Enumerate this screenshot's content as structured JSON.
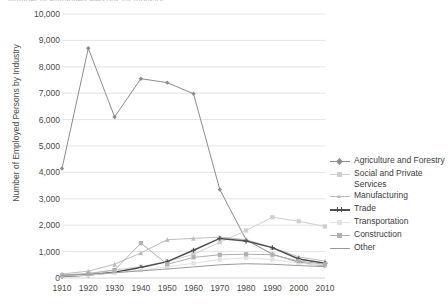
{
  "title_clipped": "Number of Employed Persons by Industry",
  "axes": {
    "ylabel": "Number of Employed Persons by Industry",
    "xlabel": "",
    "yticks": [
      "0",
      "1,000",
      "2,000",
      "3,000",
      "4,000",
      "5,000",
      "6,000",
      "7,000",
      "8,000",
      "9,000",
      "10,000"
    ],
    "xticks": [
      "1910",
      "1920",
      "1930",
      "1940",
      "1950",
      "1960",
      "1970",
      "1980",
      "1990",
      "2000",
      "2010"
    ]
  },
  "legend": {
    "position": "right",
    "items": [
      {
        "label": "Agriculture and Forestry",
        "color": "#8c8c8c",
        "marker": "diamond"
      },
      {
        "label": "Social and Private Services",
        "color": "#cfcfcf",
        "marker": "square"
      },
      {
        "label": "Manufacturing",
        "color": "#bdbdbd",
        "marker": "triangle"
      },
      {
        "label": "Trade",
        "color": "#4d4d4d",
        "marker": "cross"
      },
      {
        "label": "Transportation",
        "color": "#e2e2e2",
        "marker": "square"
      },
      {
        "label": "Construction",
        "color": "#b0b0b0",
        "marker": "square"
      },
      {
        "label": "Other",
        "color": "#9a9a9a",
        "marker": "line"
      }
    ]
  },
  "chart_data": {
    "type": "line",
    "title": "Number of Employed Persons by Industry",
    "xlabel": "",
    "ylabel": "Number of Employed Persons by Industry",
    "x": [
      1910,
      1920,
      1930,
      1940,
      1950,
      1960,
      1970,
      1980,
      1990,
      2000,
      2010
    ],
    "xlim": [
      1905,
      2015
    ],
    "ylim": [
      0,
      10000
    ],
    "ytick_step": 1000,
    "grid": true,
    "units": "thousands of persons",
    "series": [
      {
        "name": "Agriculture and Forestry",
        "color": "#8c8c8c",
        "marker": "diamond",
        "values": [
          4150,
          8700,
          6100,
          7550,
          7400,
          6980,
          3350,
          1450,
          900,
          600,
          450
        ]
      },
      {
        "name": "Social and Private Services",
        "color": "#cfcfcf",
        "marker": "square",
        "values": [
          120,
          180,
          300,
          430,
          620,
          900,
          1350,
          1800,
          2300,
          2150,
          1950
        ]
      },
      {
        "name": "Manufacturing",
        "color": "#bdbdbd",
        "marker": "triangle",
        "values": [
          150,
          260,
          520,
          950,
          1450,
          1500,
          1550,
          1450,
          1150,
          800,
          640
        ]
      },
      {
        "name": "Trade",
        "color": "#4d4d4d",
        "marker": "cross",
        "values": [
          60,
          110,
          220,
          400,
          620,
          1050,
          1500,
          1400,
          1150,
          720,
          560
        ]
      },
      {
        "name": "Transportation",
        "color": "#e2e2e2",
        "marker": "square",
        "values": [
          70,
          110,
          190,
          300,
          420,
          560,
          700,
          760,
          700,
          560,
          480
        ]
      },
      {
        "name": "Construction",
        "color": "#b0b0b0",
        "marker": "square",
        "values": [
          90,
          160,
          300,
          1320,
          520,
          780,
          880,
          900,
          880,
          640,
          520
        ]
      },
      {
        "name": "Other",
        "color": "#9a9a9a",
        "marker": "line",
        "values": [
          100,
          140,
          200,
          270,
          340,
          420,
          500,
          540,
          520,
          470,
          430
        ]
      }
    ]
  }
}
